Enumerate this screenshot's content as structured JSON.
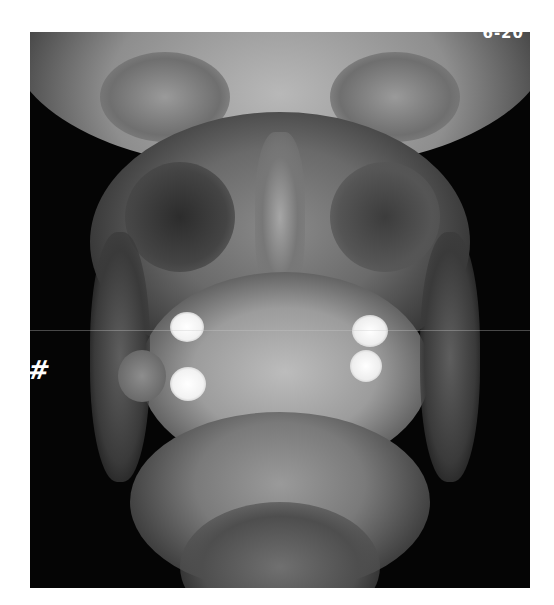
{
  "image": {
    "type": "frontal skull / mandible radiograph (X-ray)",
    "description": "Posteroanterior X-ray of face and jaw showing sinuses, orbits, teeth with bright metallic fillings on both sides, and mandible",
    "colors": {
      "background": "#ffffff",
      "film": "#050505",
      "bone": "#bdbdbd",
      "filling": "#f4f4f4"
    }
  },
  "annotations": {
    "corner_label": "6-20",
    "side_marker": "#"
  }
}
